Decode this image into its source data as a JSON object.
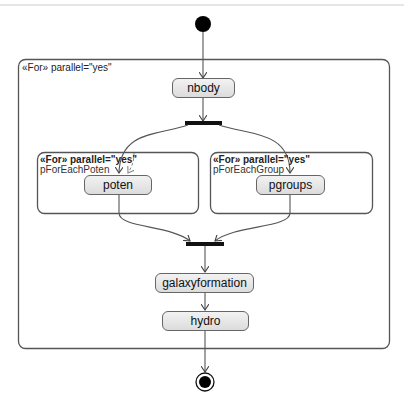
{
  "diagram": {
    "type": "UML activity diagram",
    "outer_region": {
      "stereotype": "«For»",
      "tag": "parallel=\"yes\"",
      "label": "«For» parallel=\"yes\""
    },
    "inner_regions": [
      {
        "label": "«For» parallel=\"yes\"",
        "name": "pForEachPoten",
        "action": "poten"
      },
      {
        "label": "«For» parallel=\"yes\"",
        "name": "pForEachGroup",
        "action": "pgroups"
      }
    ],
    "actions": {
      "nbody": "nbody",
      "poten": "poten",
      "pgroups": "pgroups",
      "galaxyformation": "galaxyformation",
      "hydro": "hydro"
    },
    "nodes": [
      "initial",
      "nbody",
      "fork",
      "poten",
      "pgroups",
      "join",
      "galaxyformation",
      "hydro",
      "final"
    ],
    "edges": [
      [
        "initial",
        "nbody"
      ],
      [
        "nbody",
        "fork"
      ],
      [
        "fork",
        "poten"
      ],
      [
        "fork",
        "pgroups"
      ],
      [
        "poten",
        "join"
      ],
      [
        "pgroups",
        "join"
      ],
      [
        "join",
        "galaxyformation"
      ],
      [
        "galaxyformation",
        "hydro"
      ],
      [
        "hydro",
        "final"
      ]
    ],
    "colors": {
      "line": "#555555",
      "node_fill_top": "#f2f2f2",
      "node_fill_bottom": "#dcdcdc",
      "bar": "#111111"
    }
  }
}
